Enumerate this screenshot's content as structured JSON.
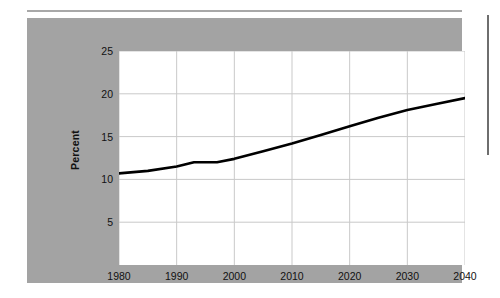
{
  "figure": {
    "background_color": "#a3a3a3",
    "plot_background_color": "#ffffff",
    "rule_color": "#a8a8a8",
    "line_color": "#000000"
  },
  "chart_data": {
    "type": "line",
    "title": "",
    "subtitle": "",
    "xlabel": "",
    "ylabel": "Percent",
    "xlim": [
      1980,
      2040
    ],
    "ylim": [
      0,
      25
    ],
    "grid": true,
    "legend": null,
    "xticks": [
      1980,
      1990,
      2000,
      2010,
      2020,
      2030,
      2040
    ],
    "xtick_labels": [
      "1980",
      "1990",
      "2000",
      "2010",
      "2020",
      "2030",
      "2040"
    ],
    "yticks": [
      5,
      10,
      15,
      20,
      25
    ],
    "ytick_labels": [
      "5",
      "10",
      "15",
      "20",
      "25"
    ],
    "series": [
      {
        "name": "Percent",
        "x": [
          1980,
          1985,
          1990,
          1993,
          1997,
          2000,
          2005,
          2010,
          2015,
          2020,
          2025,
          2030,
          2035,
          2040
        ],
        "values": [
          10.7,
          11.0,
          11.5,
          12.0,
          12.0,
          12.4,
          13.3,
          14.2,
          15.2,
          16.2,
          17.2,
          18.1,
          18.8,
          19.5
        ]
      }
    ]
  }
}
